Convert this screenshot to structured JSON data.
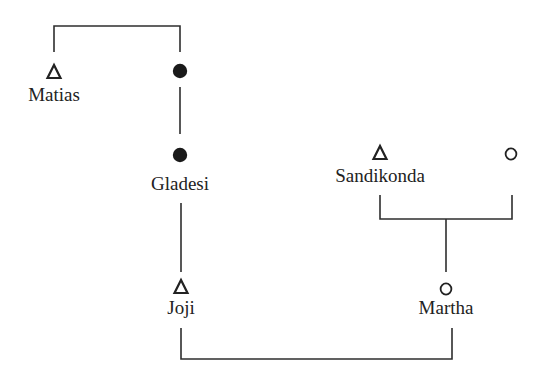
{
  "diagram": {
    "type": "kinship-chart",
    "legend_symbols": {
      "male": "triangle-icon",
      "female": "open-circle-icon",
      "female_lineage": "filled-circle-icon"
    },
    "nodes": [
      {
        "id": "matias",
        "label": "Matias",
        "symbol": "triangle",
        "x": 54,
        "y": 73,
        "label_y": 100
      },
      {
        "id": "matias-spouse",
        "label": "",
        "symbol": "filled-circle",
        "x": 180,
        "y": 71
      },
      {
        "id": "gladesi",
        "label": "Gladesi",
        "symbol": "filled-circle",
        "x": 180,
        "y": 155,
        "label_y": 190
      },
      {
        "id": "sandikonda",
        "label": "Sandikonda",
        "symbol": "triangle",
        "x": 380,
        "y": 154,
        "label_y": 181
      },
      {
        "id": "sandikonda-spouse",
        "label": "",
        "symbol": "open-circle",
        "x": 511,
        "y": 154
      },
      {
        "id": "joji",
        "label": "Joji",
        "symbol": "triangle",
        "x": 181,
        "y": 288,
        "label_y": 314
      },
      {
        "id": "martha",
        "label": "Martha",
        "symbol": "open-circle",
        "x": 446,
        "y": 290,
        "label_y": 314
      }
    ],
    "relations": [
      {
        "type": "marriage",
        "between": [
          "matias",
          "matias-spouse"
        ]
      },
      {
        "type": "descent",
        "from": "matias-spouse",
        "to": "gladesi"
      },
      {
        "type": "descent",
        "from": "gladesi",
        "to": "joji"
      },
      {
        "type": "marriage",
        "between": [
          "sandikonda",
          "sandikonda-spouse"
        ]
      },
      {
        "type": "descent",
        "from": "sandikonda-marriage",
        "to": "martha"
      },
      {
        "type": "marriage",
        "between": [
          "joji",
          "martha"
        ]
      }
    ]
  },
  "labels": {
    "matias": "Matias",
    "gladesi": "Gladesi",
    "sandikonda": "Sandikonda",
    "joji": "Joji",
    "martha": "Martha"
  },
  "colors": {
    "line": "#2e2e2e",
    "text": "#222222",
    "background": "#ffffff"
  }
}
